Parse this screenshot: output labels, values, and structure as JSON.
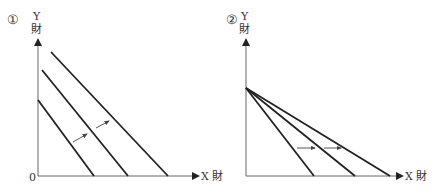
{
  "panels": [
    {
      "number": "①",
      "y_label_top": "Y",
      "y_label_bottom": "財",
      "x_label": "X 財",
      "origin_label": "0",
      "description": "Parallel outward shift of budget line (income increase)"
    },
    {
      "number": "②",
      "y_label_top": "Y",
      "y_label_bottom": "財",
      "x_label": "X 財",
      "description": "Budget line pivots outward on X axis (X price decrease)"
    }
  ],
  "colors": {
    "line": "#222222",
    "axis": "#555555",
    "text": "#333333"
  }
}
